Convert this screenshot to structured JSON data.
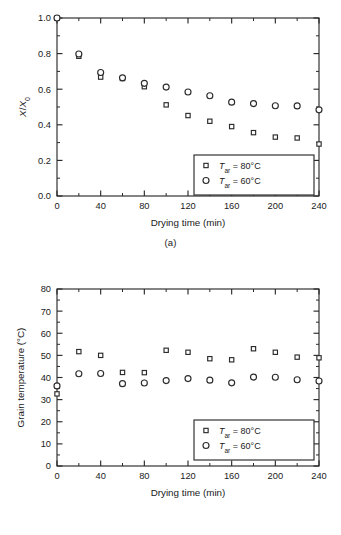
{
  "figure": {
    "panel_a_caption": "(a)",
    "panel_b_caption": "(b)"
  },
  "legend": {
    "series1_symbol": "square",
    "series2_symbol": "circle",
    "series1_var": "T",
    "series1_sub": "ar",
    "series1_value": " = 80°C",
    "series2_var": "T",
    "series2_sub": "ar",
    "series2_value": " = 60°C"
  },
  "chart_data": [
    {
      "type": "scatter",
      "panel": "(a)",
      "title": "",
      "xlabel": "Drying time (min)",
      "ylabel": "X/X0",
      "ylabel_parts": {
        "num": "X",
        "den": "X",
        "sub": "0"
      },
      "xlim": [
        0,
        240
      ],
      "ylim": [
        0.0,
        1.0
      ],
      "xticks": [
        0,
        40,
        80,
        120,
        160,
        200,
        240
      ],
      "xtick_labels": [
        "0",
        "40",
        "80",
        "120",
        "160",
        "200",
        "240"
      ],
      "xminor_step": 20,
      "yticks": [
        0.0,
        0.2,
        0.4,
        0.6,
        0.8,
        1.0
      ],
      "ytick_labels": [
        "0.0",
        "0.2",
        "0.4",
        "0.6",
        "0.8",
        "1.0"
      ],
      "yminor_step": 0.1,
      "grid": false,
      "legend_position": "lower-right",
      "x": [
        0,
        20,
        40,
        60,
        80,
        100,
        120,
        140,
        160,
        180,
        200,
        220,
        240
      ],
      "series": [
        {
          "name": "Tar = 80°C",
          "marker": "square",
          "values": [
            1.0,
            0.785,
            0.668,
            0.66,
            0.614,
            0.512,
            0.452,
            0.42,
            0.39,
            0.356,
            0.331,
            0.326,
            0.292
          ]
        },
        {
          "name": "Tar = 60°C",
          "marker": "circle",
          "values": [
            1.0,
            0.798,
            0.694,
            0.664,
            0.633,
            0.612,
            0.584,
            0.563,
            0.527,
            0.519,
            0.507,
            0.506,
            0.484
          ]
        }
      ]
    },
    {
      "type": "scatter",
      "panel": "(b)",
      "title": "",
      "xlabel": "Drying time (min)",
      "ylabel": "Grain temperature (°C)",
      "xlim": [
        0,
        240
      ],
      "ylim": [
        0,
        80
      ],
      "xticks": [
        0,
        40,
        80,
        120,
        160,
        200,
        240
      ],
      "xtick_labels": [
        "0",
        "40",
        "80",
        "120",
        "160",
        "200",
        "240"
      ],
      "xminor_step": 20,
      "yticks": [
        0,
        10,
        20,
        30,
        40,
        50,
        60,
        70,
        80
      ],
      "ytick_labels": [
        "0",
        "10",
        "20",
        "30",
        "40",
        "50",
        "60",
        "70",
        "80"
      ],
      "yminor_step": 5,
      "grid": false,
      "legend_position": "lower-right",
      "x": [
        0,
        20,
        40,
        60,
        80,
        100,
        120,
        140,
        160,
        180,
        200,
        220,
        240
      ],
      "series": [
        {
          "name": "Tar = 80°C",
          "marker": "square",
          "values": [
            32.6,
            51.7,
            50.0,
            42.3,
            42.2,
            52.3,
            51.4,
            48.5,
            48.0,
            53.0,
            51.4,
            49.2,
            48.9
          ]
        },
        {
          "name": "Tar = 60°C",
          "marker": "circle",
          "values": [
            36.2,
            41.7,
            41.8,
            37.2,
            37.5,
            38.6,
            39.5,
            38.8,
            37.6,
            40.2,
            40.1,
            39.0,
            38.4
          ]
        }
      ]
    }
  ]
}
